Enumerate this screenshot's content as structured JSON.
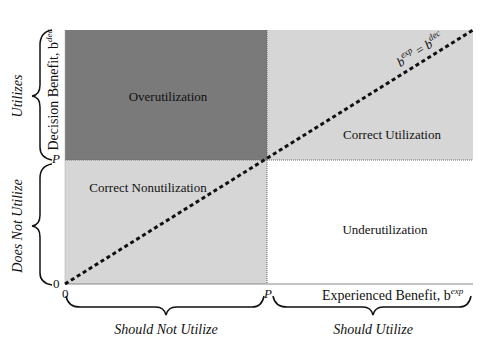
{
  "diagram": {
    "quadrants": {
      "top_left": {
        "label": "Overutilization",
        "color": "#7a7a7a"
      },
      "top_right": {
        "label": "Correct Utilization",
        "color": "#d6d6d6"
      },
      "bottom_left": {
        "label": "Correct Nonutilization",
        "color": "#d6d6d6"
      },
      "bottom_right": {
        "label": "Underutilization",
        "color": "#ffffff"
      }
    },
    "y_axis": {
      "label": "Decision Benefit, b",
      "label_sup": "dec",
      "ticks": {
        "zero": "0",
        "p": "P"
      }
    },
    "x_axis": {
      "label": "Experienced Benefit, b",
      "label_sup": "exp",
      "ticks": {
        "zero": "0",
        "p": "P"
      }
    },
    "diagonal": {
      "lhs": "b",
      "lhs_sup": "exp",
      "eq": " = ",
      "rhs": "b",
      "rhs_sup": "dec"
    },
    "braces": {
      "left_top": "Utilizes",
      "left_bottom": "Does Not Utilize",
      "bottom_left": "Should Not Utilize",
      "bottom_right": "Should Utilize"
    }
  }
}
